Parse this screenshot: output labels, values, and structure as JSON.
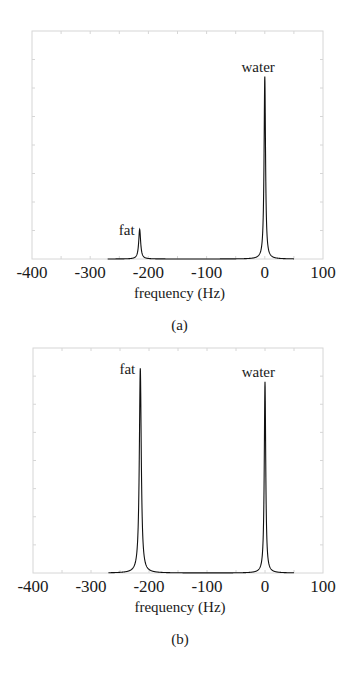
{
  "chart_data": [
    {
      "type": "line",
      "panel": "(a)",
      "title": "",
      "xlabel": "frequency (Hz)",
      "ylabel": "",
      "xlim": [
        -400,
        100
      ],
      "ylim": [
        0,
        1
      ],
      "xticks": [
        -400,
        -300,
        -200,
        -100,
        0,
        100
      ],
      "grid": false,
      "series": [
        {
          "name": "spectrum",
          "peaks": [
            {
              "label": "fat",
              "x": -215,
              "height": 0.13,
              "linewidth_hz": 4
            },
            {
              "label": "water",
              "x": 0,
              "height": 0.8,
              "linewidth_hz": 3
            }
          ],
          "x_span": [
            -270,
            50
          ]
        }
      ],
      "annotations": [
        {
          "text": "fat",
          "x": -215,
          "y": 0.13
        },
        {
          "text": "water",
          "x": 0,
          "y": 0.8
        }
      ],
      "caption": "(a)"
    },
    {
      "type": "line",
      "panel": "(b)",
      "title": "",
      "xlabel": "frequency (Hz)",
      "ylabel": "",
      "xlim": [
        -400,
        100
      ],
      "ylim": [
        0,
        1
      ],
      "xticks": [
        -400,
        -300,
        -200,
        -100,
        0,
        100
      ],
      "grid": false,
      "series": [
        {
          "name": "spectrum",
          "peaks": [
            {
              "label": "fat",
              "x": -215,
              "height": 0.91,
              "linewidth_hz": 4
            },
            {
              "label": "water",
              "x": 0,
              "height": 0.85,
              "linewidth_hz": 3
            }
          ],
          "x_span": [
            -270,
            50
          ]
        }
      ],
      "annotations": [
        {
          "text": "fat",
          "x": -215,
          "y": 0.91
        },
        {
          "text": "water",
          "x": 0,
          "y": 0.85
        }
      ],
      "caption": "(b)"
    }
  ],
  "panels": [
    {
      "frame": {
        "x0": 32,
        "y0": 31,
        "x1": 323,
        "y1": 259
      },
      "tick_labels": [
        "-400",
        "-300",
        "-200",
        "-100",
        "0",
        "100"
      ],
      "xlabel": "frequency (Hz)",
      "caption": "(a)",
      "labels": {
        "fat": "fat",
        "water": "water"
      }
    },
    {
      "frame": {
        "x0": 33,
        "y0": 348,
        "x1": 323,
        "y1": 573
      },
      "tick_labels": [
        "-400",
        "-300",
        "-200",
        "-100",
        "0",
        "100"
      ],
      "xlabel": "frequency (Hz)",
      "caption": "(b)",
      "labels": {
        "fat": "fat",
        "water": "water"
      }
    }
  ],
  "colors": {
    "frame": "#d6d6d6",
    "line": "#111111",
    "text": "#1a1a1a"
  }
}
